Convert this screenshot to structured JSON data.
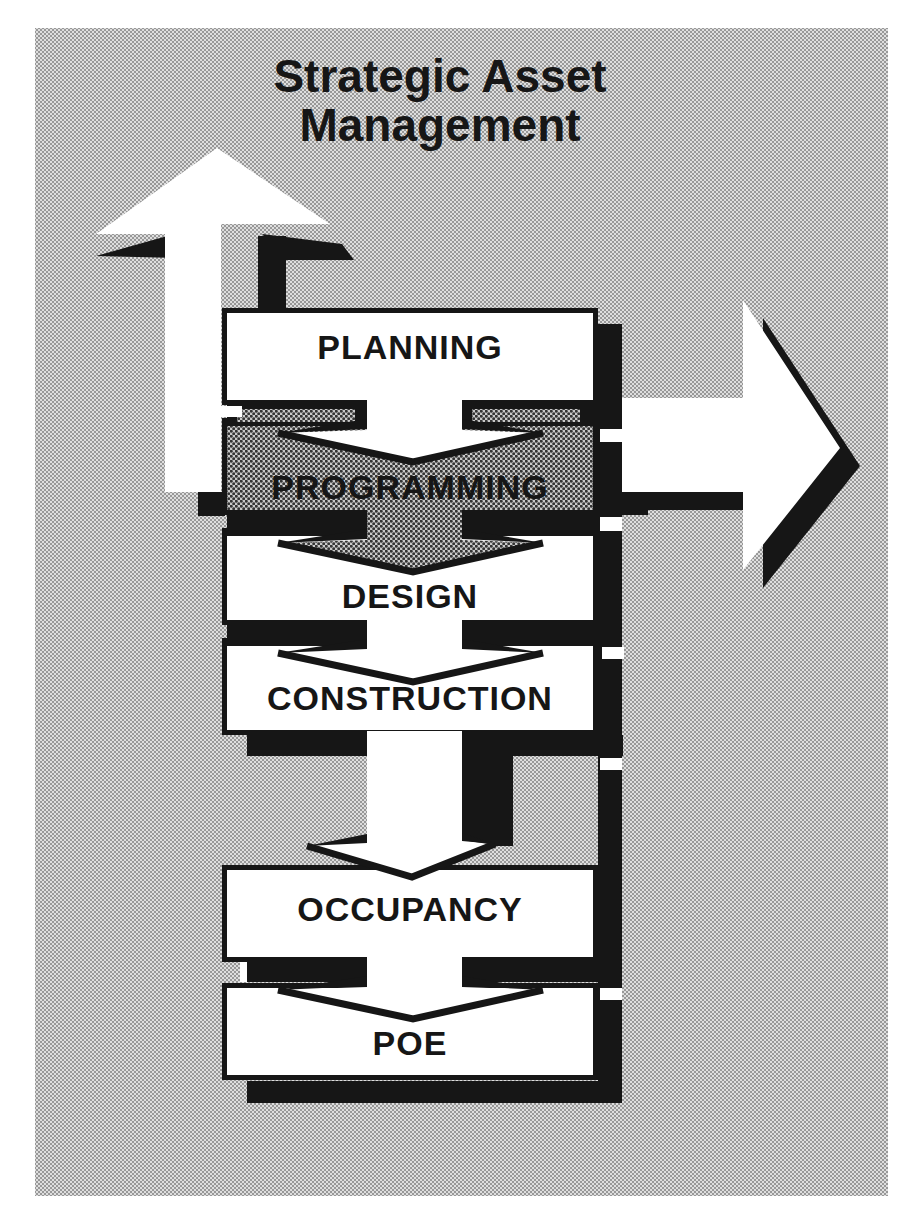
{
  "title": {
    "line1": "Strategic Asset",
    "line2": "Management"
  },
  "stages": [
    {
      "label": "PLANNING",
      "fill": "white"
    },
    {
      "label": "PROGRAMMING",
      "fill": "halftone-gray"
    },
    {
      "label": "DESIGN",
      "fill": "white"
    },
    {
      "label": "CONSTRUCTION",
      "fill": "white"
    },
    {
      "label": "OCCUPANCY",
      "fill": "white"
    },
    {
      "label": "POE",
      "fill": "white"
    }
  ],
  "flow": {
    "sequence": [
      "PLANNING",
      "PROGRAMMING",
      "DESIGN",
      "CONSTRUCTION",
      "OCCUPANCY",
      "POE"
    ],
    "feedback_up_arrow_target": "Strategic Asset Management",
    "side_exit_arrow_direction": "right"
  },
  "icons": [
    {
      "name": "up-arrow-icon",
      "glyph": "⬆"
    },
    {
      "name": "right-arrow-icon",
      "glyph": "➡"
    },
    {
      "name": "chevron-down-connector-icon",
      "glyph": "⌄"
    }
  ],
  "colors": {
    "ink": "#161616",
    "paper": "#ffffff",
    "halftone_background_base": "#dedede",
    "halftone_background_dot": "#989898",
    "shaded_box_base": "#c9c9c9",
    "shaded_box_dot": "#343434"
  }
}
